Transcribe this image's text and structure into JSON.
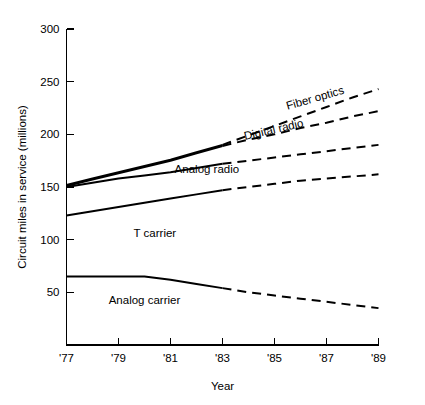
{
  "chart_data": {
    "type": "line",
    "title": "",
    "xlabel": "Year",
    "ylabel": "Circuit miles in service (millions)",
    "xlim": [
      1977,
      1989
    ],
    "ylim": [
      0,
      300
    ],
    "xticks": [
      "'77",
      "'79",
      "'81",
      "'83",
      "'85",
      "'87",
      "'89"
    ],
    "xtick_values": [
      1977,
      1979,
      1981,
      1983,
      1985,
      1987,
      1989
    ],
    "yticks": [
      "50",
      "100",
      "150",
      "200",
      "250",
      "300"
    ],
    "ytick_values": [
      50,
      100,
      150,
      200,
      250,
      300
    ],
    "grid": false,
    "legend": "inline-labels",
    "x": [
      1977,
      1978,
      1979,
      1980,
      1981,
      1982,
      1983,
      1984,
      1985,
      1986,
      1987,
      1988,
      1989
    ],
    "series": [
      {
        "name": "Fiber optics",
        "label": "Fiber optics",
        "solid_until": 1983,
        "values": [
          152,
          158,
          164,
          170,
          176,
          183,
          190,
          199,
          208,
          217,
          226,
          235,
          243
        ]
      },
      {
        "name": "Digital radio",
        "label": "Digital radio",
        "solid_until": 1983,
        "values": [
          151,
          157,
          163,
          169,
          175,
          182,
          189,
          195,
          200,
          206,
          211,
          217,
          222
        ]
      },
      {
        "name": "Analog radio",
        "label": "Analog radio",
        "solid_until": 1983,
        "values": [
          150,
          154,
          158,
          161,
          164,
          168,
          172,
          175,
          178,
          181,
          184,
          187,
          190
        ]
      },
      {
        "name": "T carrier",
        "label": "T carrier",
        "solid_until": 1983,
        "values": [
          123,
          127,
          131,
          135,
          139,
          143,
          147,
          150,
          153,
          156,
          158,
          160,
          162
        ]
      },
      {
        "name": "Analog carrier",
        "label": "Analog carrier",
        "solid_until": 1983,
        "values": [
          65,
          65,
          65,
          65,
          62,
          58,
          54,
          50,
          47,
          44,
          41,
          38,
          35
        ]
      }
    ],
    "annotations": [
      {
        "text": "Fiber optics",
        "x": 1986.6,
        "y": 231,
        "rotation": -16
      },
      {
        "text": "Digital radio",
        "x": 1985.0,
        "y": 201,
        "rotation": -13
      },
      {
        "text": "Analog radio",
        "x": 1982.4,
        "y": 163,
        "rotation": 0
      },
      {
        "text": "T carrier",
        "x": 1980.4,
        "y": 103,
        "rotation": 0
      },
      {
        "text": "Analog carrier",
        "x": 1980.0,
        "y": 39,
        "rotation": 0
      }
    ],
    "colors": {
      "line": "#000000",
      "axis": "#000000",
      "background": "#ffffff"
    }
  }
}
